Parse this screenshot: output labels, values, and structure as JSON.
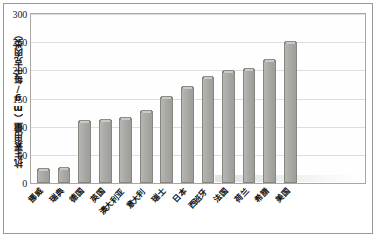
{
  "chart_data": {
    "type": "bar",
    "title": "",
    "subtitle": "",
    "xlabel": "",
    "ylabel": "抗生素用量（mg/每千克肉类）",
    "ylim": [
      0,
      300
    ],
    "ytick_labels": [
      "0",
      "50",
      "100",
      "150",
      "200",
      "250",
      "300"
    ],
    "ytick_values": [
      0,
      50,
      100,
      150,
      200,
      250,
      300
    ],
    "grid": true,
    "legend": false,
    "legend_position": "none",
    "categories": [
      "挪威",
      "瑞典",
      "德国",
      "英国",
      "澳大利亚",
      "意大利",
      "瑞士",
      "日本",
      "西班牙",
      "法国",
      "荷兰",
      "希腊",
      "美国"
    ],
    "values": [
      25,
      27,
      110,
      112,
      116,
      128,
      152,
      170,
      188,
      198,
      202,
      218,
      250
    ],
    "series": [
      {
        "name": "抗生素用量",
        "values": [
          25,
          27,
          110,
          112,
          116,
          128,
          152,
          170,
          188,
          198,
          202,
          218,
          250
        ]
      }
    ],
    "bar_color": "#a9a9a5",
    "bar_edge_color": "#86867f",
    "grid_color": "#dedede",
    "frame_color": "#a8a8a0"
  }
}
